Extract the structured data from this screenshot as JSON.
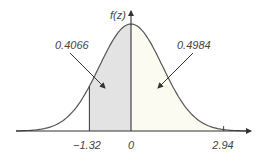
{
  "chart_data": {
    "type": "area",
    "title": "",
    "xlabel": "z",
    "ylabel": "f(z)",
    "distribution": "standard normal",
    "mean": 0,
    "sd": 1,
    "x_tick_labels": [
      "-1.32",
      "0",
      "2.94"
    ],
    "x_ticks": [
      -1.32,
      0,
      2.94
    ],
    "shaded_regions": [
      {
        "from": -1.32,
        "to": 0,
        "area": 0.4066,
        "label": "0.4066",
        "fill": "#e3e3e3"
      },
      {
        "from": 0,
        "to": 2.94,
        "area": 0.4984,
        "label": "0.4984",
        "fill": "#fbfbf2"
      }
    ],
    "annotations": [
      "0.4066",
      "0.4984"
    ],
    "grid": false,
    "legend": null
  },
  "labels": {
    "y_axis": "f(z)",
    "tick_neg": "−1.32",
    "tick_zero": "0",
    "tick_pos": "2.94",
    "area_left": "0.4066",
    "area_right": "0.4984"
  },
  "colors": {
    "curve": "#555555",
    "axis": "#333333",
    "left_fill": "#e3e3e3",
    "right_fill": "#fbfbf2",
    "text": "#444444"
  }
}
